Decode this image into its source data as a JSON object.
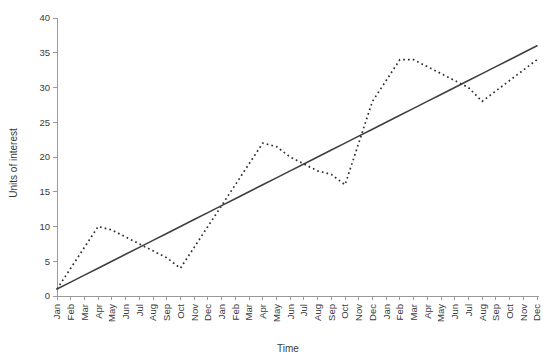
{
  "chart_data": {
    "type": "line",
    "title": "",
    "xlabel": "Time",
    "ylabel": "Units of interest",
    "ylim": [
      0,
      40
    ],
    "yticks": [
      0,
      5,
      10,
      15,
      20,
      25,
      30,
      35,
      40
    ],
    "grid": false,
    "legend": "none",
    "categories": [
      "Jan",
      "Feb",
      "Mar",
      "Apr",
      "May",
      "Jun",
      "Jul",
      "Aug",
      "Sep",
      "Oct",
      "Nov",
      "Dec",
      "Jan",
      "Feb",
      "Mar",
      "Apr",
      "May",
      "Jun",
      "Jul",
      "Aug",
      "Sep",
      "Oct",
      "Nov",
      "Dec",
      "Jan",
      "Feb",
      "Mar",
      "Apr",
      "May",
      "Jun",
      "Jul",
      "Aug",
      "Sep",
      "Oct",
      "Nov",
      "Dec"
    ],
    "series": [
      {
        "name": "Seasonal series",
        "style": "dotted",
        "color": "#303030",
        "values": [
          1,
          4,
          7,
          10,
          9.5,
          8.5,
          7.5,
          6.5,
          5.5,
          4,
          7,
          10,
          13,
          16,
          19,
          22,
          21.5,
          20,
          19,
          18,
          17.5,
          16,
          22,
          28,
          31,
          34,
          34,
          33,
          32,
          31,
          30,
          28,
          29.5,
          31,
          32.5,
          34
        ]
      },
      {
        "name": "Trend line",
        "style": "solid",
        "color": "#3f3f3f",
        "values": [
          1,
          2,
          3,
          4,
          5,
          6,
          7,
          8,
          9,
          10,
          11,
          12,
          13,
          14,
          15,
          16,
          17,
          18,
          19,
          20,
          21,
          22,
          23,
          24,
          25,
          26,
          27,
          28,
          29,
          30,
          31,
          32,
          33,
          34,
          35,
          36
        ]
      }
    ]
  }
}
